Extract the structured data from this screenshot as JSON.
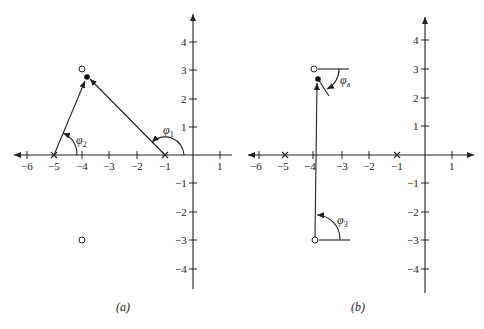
{
  "figure": {
    "panel_a": {
      "caption": "(a)",
      "x_ticks": [
        "−6",
        "−5",
        "−4",
        "−3",
        "−2",
        "−1",
        "1"
      ],
      "y_ticks": [
        "4",
        "3",
        "2",
        "1",
        "−1",
        "−2",
        "−3",
        "−4"
      ],
      "angle_labels": {
        "phi1": "φ",
        "phi1_sub": "1",
        "phi2": "φ",
        "phi2_sub": "2"
      }
    },
    "panel_b": {
      "caption": "(b)",
      "x_ticks": [
        "−6",
        "−5",
        "−4",
        "−3",
        "−2",
        "−1",
        "1"
      ],
      "y_ticks": [
        "4",
        "3",
        "2",
        "1",
        "−1",
        "−2",
        "−3",
        "−4"
      ],
      "angle_labels": {
        "phia": "φ",
        "phia_sub": "a",
        "phi3": "φ",
        "phi3_sub": "3"
      }
    }
  },
  "poles": [
    {
      "re": -1,
      "im": 0
    },
    {
      "re": -5,
      "im": 0
    }
  ],
  "zeros": [
    {
      "re": -4,
      "im": 3
    },
    {
      "re": -4,
      "im": -3
    }
  ],
  "test_point": {
    "re": -3.8,
    "im": 2.7
  }
}
